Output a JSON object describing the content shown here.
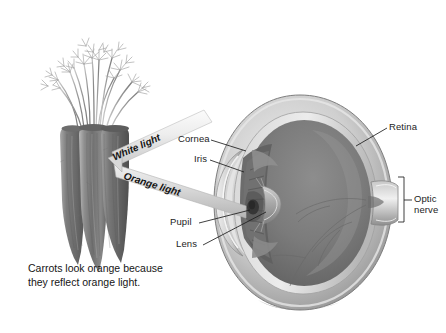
{
  "figure": {
    "title_caption": "Carrots look orange because\nthey reflect orange light.",
    "background_color": "#ffffff",
    "ink_color": "#1d1d1d"
  },
  "beams": [
    {
      "id": "white-light",
      "label": "White light",
      "direction": "from upper-left light source down to the carrot",
      "angle_deg": -22,
      "color": "#e9e9e9"
    },
    {
      "id": "orange-light",
      "label": "Orange light",
      "direction": "reflected from the carrot toward the eye",
      "angle_deg": 18,
      "color": "#d7d7d7"
    }
  ],
  "eye_labels": [
    {
      "id": "cornea",
      "label": "Cornea",
      "x": 178,
      "y": 138
    },
    {
      "id": "iris",
      "label": "Iris",
      "x": 196,
      "y": 158
    },
    {
      "id": "pupil",
      "label": "Pupil",
      "x": 176,
      "y": 221
    },
    {
      "id": "lens",
      "label": "Lens",
      "x": 181,
      "y": 243
    },
    {
      "id": "retina",
      "label": "Retina",
      "x": 390,
      "y": 125
    },
    {
      "id": "optic-nerve",
      "label": "Optic\nnerve",
      "x": 404,
      "y": 198
    }
  ],
  "objects": {
    "carrots": {
      "name": "Bunch of three carrots with leafy tops",
      "count": 3
    },
    "eye": {
      "name": "Cutaway cross-section of a human eyeball"
    }
  }
}
